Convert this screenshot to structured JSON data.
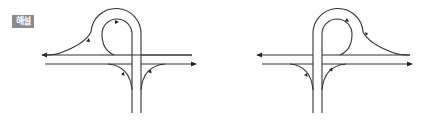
{
  "label": {
    "text": "해설",
    "background": "#8a8a8a",
    "color": "#ffffff"
  },
  "diagrams": [
    {
      "name": "left-interchange",
      "loop_side": "left",
      "description": "Partial cloverleaf / trumpet-style loop ramp on left side of crossing road"
    },
    {
      "name": "right-interchange",
      "loop_side": "right",
      "description": "Mirrored partial cloverleaf / trumpet-style loop ramp on right side of crossing road"
    }
  ],
  "colors": {
    "line": "#333333",
    "arrow": "#222222",
    "background": "#ffffff"
  }
}
